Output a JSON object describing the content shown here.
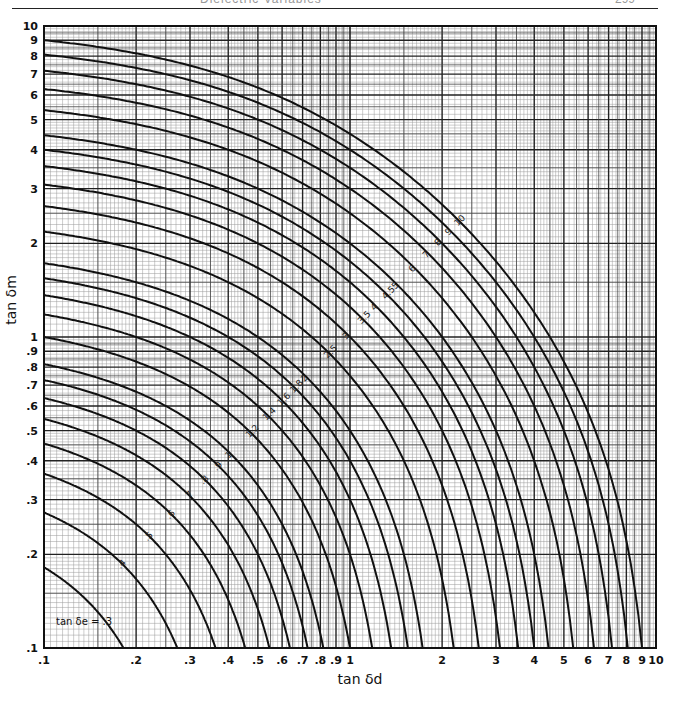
{
  "header": {
    "title": "Dielectric Variables",
    "page_number": "299"
  },
  "chart_data": {
    "type": "line",
    "title": "",
    "xlabel": "tan δd",
    "ylabel": "tan δm",
    "xscale": "log",
    "yscale": "log",
    "xlim": [
      0.1,
      10
    ],
    "ylim": [
      0.1,
      10
    ],
    "grid": true,
    "x_ticks": [
      ".1",
      ".2",
      ".3",
      ".4",
      ".5",
      ".6",
      ".7",
      ".8",
      ".9",
      "1",
      "2",
      "3",
      "4",
      "5",
      "6",
      "7",
      "8",
      "9",
      "10"
    ],
    "x_tick_values": [
      0.1,
      0.2,
      0.3,
      0.4,
      0.5,
      0.6,
      0.7,
      0.8,
      0.9,
      1,
      2,
      3,
      4,
      5,
      6,
      7,
      8,
      9,
      10
    ],
    "y_ticks": [
      ".1",
      ".2",
      ".3",
      ".4",
      ".5",
      ".6",
      ".7",
      ".8",
      ".9",
      "1",
      "2",
      "3",
      "4",
      "5",
      "6",
      "7",
      "8",
      "9",
      "10"
    ],
    "y_tick_values": [
      0.1,
      0.2,
      0.3,
      0.4,
      0.5,
      0.6,
      0.7,
      0.8,
      0.9,
      1,
      2,
      3,
      4,
      5,
      6,
      7,
      8,
      9,
      10
    ],
    "relation": "(1 + tan δe) = (1 + tan δd)(1 + tan δm)",
    "series_parameter": "tan δe",
    "series": [
      {
        "name": "tan δe = .3",
        "value": 0.3,
        "label": ".3"
      },
      {
        "name": "tan δe = .4",
        "value": 0.4,
        "label": ".4"
      },
      {
        "name": "tan δe = .5",
        "value": 0.5,
        "label": ".5"
      },
      {
        "name": "tan δe = .6",
        "value": 0.6,
        "label": ".6"
      },
      {
        "name": "tan δe = .7",
        "value": 0.7,
        "label": ".7"
      },
      {
        "name": "tan δe = .8",
        "value": 0.8,
        "label": ".8"
      },
      {
        "name": "tan δe = .9",
        "value": 0.9,
        "label": ".9"
      },
      {
        "name": "tan δe = 1",
        "value": 1.0,
        "label": "1"
      },
      {
        "name": "tan δe = 1.2",
        "value": 1.2,
        "label": "1.2"
      },
      {
        "name": "tan δe = 1.4",
        "value": 1.4,
        "label": "1.4"
      },
      {
        "name": "tan δe = 1.6",
        "value": 1.6,
        "label": "1.6"
      },
      {
        "name": "tan δe = 1.8",
        "value": 1.8,
        "label": "1.8"
      },
      {
        "name": "tan δe = 2",
        "value": 2.0,
        "label": "2"
      },
      {
        "name": "tan δe = 2.5",
        "value": 2.5,
        "label": "2.5"
      },
      {
        "name": "tan δe = 3",
        "value": 3.0,
        "label": "3"
      },
      {
        "name": "tan δe = 3.5",
        "value": 3.5,
        "label": "3.5"
      },
      {
        "name": "tan δe = 4",
        "value": 4.0,
        "label": "4"
      },
      {
        "name": "tan δe = 4.5",
        "value": 4.5,
        "label": "4.5"
      },
      {
        "name": "tan δe = 5",
        "value": 5.0,
        "label": "5"
      },
      {
        "name": "tan δe = 6",
        "value": 6.0,
        "label": "6"
      },
      {
        "name": "tan δe = 7",
        "value": 7.0,
        "label": "7"
      },
      {
        "name": "tan δe = 8",
        "value": 8.0,
        "label": "8"
      },
      {
        "name": "tan δe = 9",
        "value": 9.0,
        "label": "9"
      },
      {
        "name": "tan δe = 10",
        "value": 10.0,
        "label": "10"
      }
    ],
    "annotations": [
      {
        "text": "tan δe = .3",
        "position": "lower-left, near tan δd .1–.2, tan δm .12"
      }
    ]
  },
  "colors": {
    "ink": "#111111",
    "grid_minor": "#9a9a9a",
    "grid_major": "#222222",
    "paper": "#ffffff"
  }
}
